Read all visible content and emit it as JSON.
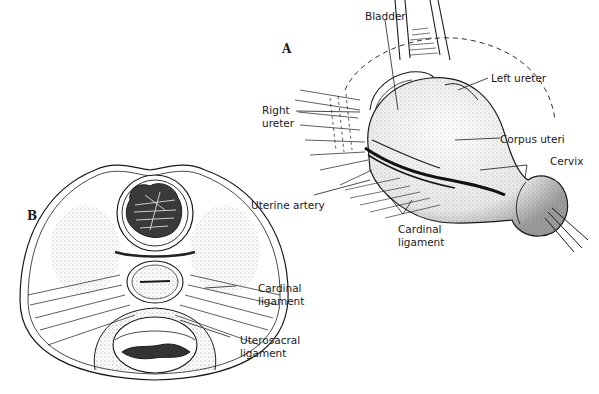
{
  "figure": {
    "panels": [
      {
        "id": "A",
        "label": "A",
        "labels": {
          "bladder": "Bladder",
          "left_ureter": "Left ureter",
          "right_ureter_line1": "Right",
          "right_ureter_line2": "ureter",
          "corpus_uteri": "Corpus uteri",
          "cervix": "Cervix",
          "uterine_artery": "Uterine artery",
          "cardinal_ligament_line1": "Cardinal",
          "cardinal_ligament_line2": "ligament"
        }
      },
      {
        "id": "B",
        "label": "B",
        "labels": {
          "cardinal_ligament_line1": "Cardinal",
          "cardinal_ligament_line2": "ligament",
          "uterosacral_ligament_line1": "Uterosacral",
          "uterosacral_ligament_line2": "ligament"
        }
      }
    ]
  }
}
